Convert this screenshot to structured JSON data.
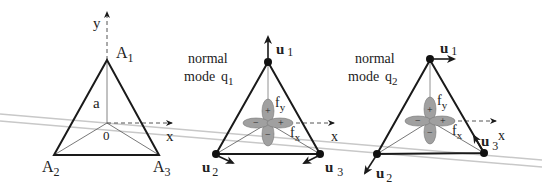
{
  "panels": [
    {
      "id": "reference",
      "vertices": [
        "A1",
        "A2",
        "A3"
      ],
      "labels": {
        "A1": "A",
        "A1_sub": "1",
        "A2": "A",
        "A2_sub": "2",
        "A3": "A",
        "A3_sub": "3",
        "height": "a",
        "origin": "0",
        "x_axis": "x",
        "y_axis": "y"
      }
    },
    {
      "id": "mode-q1",
      "title_line1": "normal",
      "title_line2": "mode",
      "mode": "q",
      "mode_sub": "1",
      "displacements": {
        "u1": "u",
        "u1_sub": "1",
        "u2": "u",
        "u2_sub": "2",
        "u3": "u",
        "u3_sub": "3"
      },
      "orbitals": {
        "fy": "f",
        "fy_sub": "y",
        "fx": "f",
        "fx_sub": "x",
        "plus": "+",
        "minus": "−"
      },
      "x_axis": "x"
    },
    {
      "id": "mode-q2",
      "title_line1": "normal",
      "title_line2": "mode",
      "mode": "q",
      "mode_sub": "2",
      "displacements": {
        "u1": "u",
        "u1_sub": "1",
        "u2": "u",
        "u2_sub": "2",
        "u3": "u",
        "u3_sub": "3"
      },
      "orbitals": {
        "fy": "f",
        "fy_sub": "y",
        "fx": "f",
        "fx_sub": "x",
        "plus": "+",
        "minus": "−"
      },
      "x_axis": "x"
    }
  ],
  "colors": {
    "line": "#1a1a1a",
    "thin": "#555555",
    "orbital": "#9a9a9a",
    "scan_line": "#c8c8c8"
  }
}
